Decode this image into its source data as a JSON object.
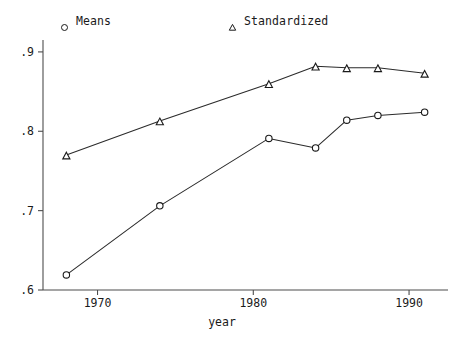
{
  "chart_data": {
    "type": "line",
    "title": "",
    "xlabel": "year",
    "ylabel": "",
    "xlim": [
      1966.5,
      1992.5
    ],
    "ylim": [
      0.6,
      0.915
    ],
    "grid": false,
    "legend_position": "top",
    "x_ticks": [
      1970,
      1980,
      1990
    ],
    "x_tick_labels": [
      "1970",
      "1980",
      "1990"
    ],
    "y_ticks": [
      0.6,
      0.7,
      0.8,
      0.9
    ],
    "y_tick_labels": [
      ".6",
      ".7",
      ".8",
      ".9"
    ],
    "x": [
      1968,
      1974,
      1981,
      1984,
      1986,
      1988,
      1991
    ],
    "series": [
      {
        "name": "Means",
        "marker": "circle",
        "values": [
          0.619,
          0.706,
          0.791,
          0.779,
          0.814,
          0.82,
          0.824
        ]
      },
      {
        "name": "Standardized",
        "marker": "triangle",
        "values": [
          0.77,
          0.813,
          0.86,
          0.882,
          0.88,
          0.88,
          0.873
        ]
      }
    ]
  },
  "legend": {
    "means_label": "Means",
    "standardized_label": "Standardized",
    "means_marker": "circle-marker-icon",
    "standardized_marker": "triangle-marker-icon"
  },
  "axes": {
    "x_title": "year",
    "y_tick_0": ".9",
    "y_tick_1": ".8",
    "y_tick_2": ".7",
    "y_tick_3": ".6",
    "x_tick_0": "1970",
    "x_tick_1": "1980",
    "x_tick_2": "1990"
  },
  "colors": {
    "line": "#2b2b2b",
    "axis": "#4d4d4d",
    "text": "#1a1a1a",
    "background": "#ffffff"
  }
}
